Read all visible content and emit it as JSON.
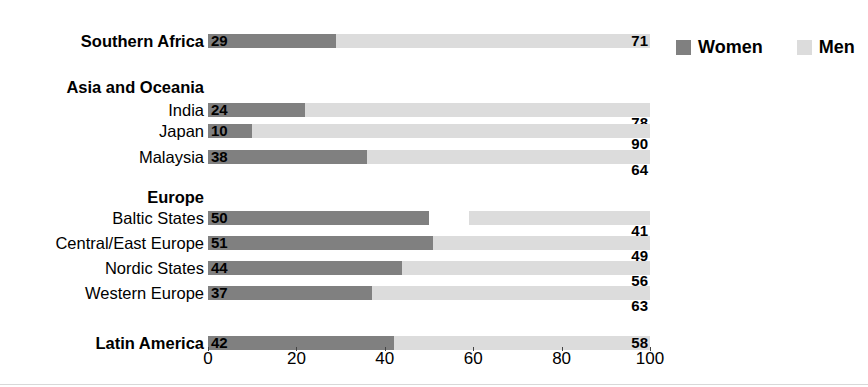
{
  "chart_data": {
    "type": "bar",
    "subtype": "stacked-horizontal-100",
    "title": "duction",
    "title_clipped": true,
    "xlabel": "",
    "ylabel": "",
    "xlim": [
      0,
      100
    ],
    "xticks": [
      0,
      20,
      40,
      60,
      80,
      100
    ],
    "xtick_labels": [
      "0",
      "20",
      "40",
      "60",
      "80",
      "100"
    ],
    "grid": false,
    "legend_position": "top-right",
    "series": [
      {
        "name": "Women",
        "color": "#808080",
        "values": [
          29,
          24,
          10,
          38,
          50,
          51,
          44,
          37,
          42
        ]
      },
      {
        "name": "Men",
        "color": "#dcdcdc",
        "values": [
          71,
          78,
          90,
          64,
          41,
          49,
          56,
          63,
          58
        ]
      }
    ],
    "categories": [
      "Southern Africa",
      "India",
      "Japan",
      "Malaysia",
      "Baltic States",
      "Central/East Europe",
      "Nordic States",
      "Western Europe",
      "Latin America"
    ],
    "group_headings": [
      "Asia and Oceania",
      "Europe"
    ]
  },
  "legend": {
    "items": [
      {
        "label": "Women",
        "color": "#808080"
      },
      {
        "label": "Men",
        "color": "#dcdcdc"
      }
    ]
  },
  "rows": [
    {
      "label": "Southern Africa",
      "bold": true,
      "women": 29,
      "men": 71,
      "men_inline": true,
      "top": 34
    },
    {
      "label": "India",
      "bold": false,
      "women": 24,
      "men": 78,
      "men_inline": false,
      "top": 103
    },
    {
      "label": "Japan",
      "bold": false,
      "women": 10,
      "men": 90,
      "men_inline": false,
      "top": 124
    },
    {
      "label": "Malaysia",
      "bold": false,
      "women": 38,
      "men": 64,
      "men_inline": false,
      "top": 150
    },
    {
      "label": "Baltic States",
      "bold": false,
      "women": 50,
      "men": 41,
      "men_inline": false,
      "top": 211
    },
    {
      "label": "Central/East Europe",
      "bold": false,
      "women": 51,
      "men": 49,
      "men_inline": false,
      "top": 236
    },
    {
      "label": "Nordic States",
      "bold": false,
      "women": 44,
      "men": 56,
      "men_inline": false,
      "top": 261
    },
    {
      "label": "Western Europe",
      "bold": false,
      "women": 37,
      "men": 63,
      "men_inline": false,
      "top": 286
    },
    {
      "label": "Latin America",
      "bold": true,
      "women": 42,
      "men": 58,
      "men_inline": true,
      "top": 336
    }
  ],
  "group_headings": [
    {
      "label": "Asia and Oceania",
      "top": 80
    },
    {
      "label": "Europe",
      "top": 190
    }
  ],
  "axis": {
    "ticks": [
      {
        "label": "0",
        "value": 0
      },
      {
        "label": "20",
        "value": 20
      },
      {
        "label": "40",
        "value": 40
      },
      {
        "label": "60",
        "value": 60
      },
      {
        "label": "80",
        "value": 80
      },
      {
        "label": "100",
        "value": 100
      }
    ]
  },
  "colors": {
    "women": "#808080",
    "men": "#dcdcdc",
    "text": "#000000"
  }
}
